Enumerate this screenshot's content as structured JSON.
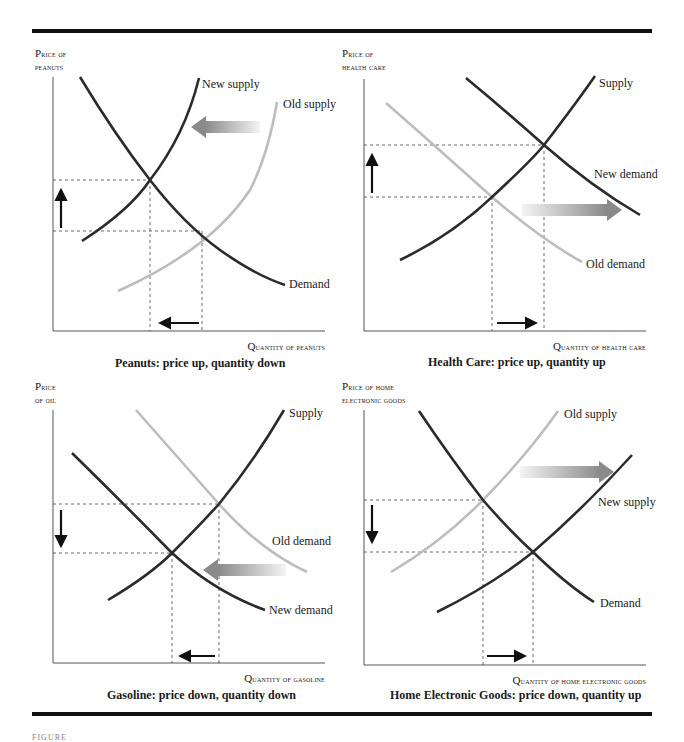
{
  "figure": {
    "footer_text": "FIGURE"
  },
  "colors": {
    "dark_curve": "#2b2b2b",
    "light_curve": "#bdbdbd",
    "axis": "#555555",
    "dashed": "#444444",
    "shift_arrow_start": "#f2f2f2",
    "shift_arrow_end": "#8a8a8a"
  },
  "panels": [
    {
      "id": "peanuts",
      "y_label_line1": "Price of",
      "y_label_line2": "peanuts",
      "x_label": "Quantity of peanuts",
      "caption": "Peanuts: price up, quantity down",
      "curves": [
        {
          "name": "New supply",
          "shade": "dark"
        },
        {
          "name": "Old supply",
          "shade": "light"
        },
        {
          "name": "Demand",
          "shade": "dark"
        }
      ],
      "shift": "supply left",
      "price_change": "up",
      "quantity_change": "down"
    },
    {
      "id": "health-care",
      "y_label_line1": "Price of",
      "y_label_line2": "health care",
      "x_label": "Quantity of health care",
      "caption": "Health Care: price up, quantity up",
      "curves": [
        {
          "name": "Supply",
          "shade": "dark"
        },
        {
          "name": "New demand",
          "shade": "dark"
        },
        {
          "name": "Old demand",
          "shade": "light"
        }
      ],
      "shift": "demand right",
      "price_change": "up",
      "quantity_change": "up"
    },
    {
      "id": "gasoline",
      "y_label_line1": "Price",
      "y_label_line2": "of oil",
      "x_label": "Quantity of gasoline",
      "caption": "Gasoline: price down, quantity down",
      "curves": [
        {
          "name": "Supply",
          "shade": "dark"
        },
        {
          "name": "Old demand",
          "shade": "light"
        },
        {
          "name": "New demand",
          "shade": "dark"
        }
      ],
      "shift": "demand left",
      "price_change": "down",
      "quantity_change": "down"
    },
    {
      "id": "home-electronics",
      "y_label_line1": "Price of home",
      "y_label_line2": "electronic goods",
      "x_label": "Quantity of home electronic goods",
      "caption": "Home Electronic Goods: price down, quantity up",
      "curves": [
        {
          "name": "Old supply",
          "shade": "light"
        },
        {
          "name": "New supply",
          "shade": "dark"
        },
        {
          "name": "Demand",
          "shade": "dark"
        }
      ],
      "shift": "supply right",
      "price_change": "down",
      "quantity_change": "up"
    }
  ]
}
